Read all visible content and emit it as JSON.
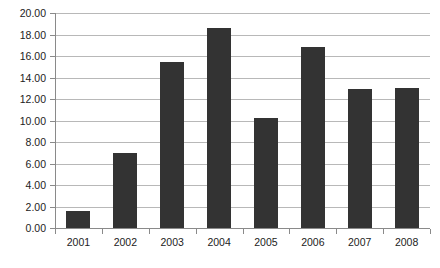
{
  "chart_data": {
    "type": "bar",
    "title": "",
    "subtitle": "",
    "xlabel": "",
    "ylabel": "",
    "categories": [
      "2001",
      "2002",
      "2003",
      "2004",
      "2005",
      "2006",
      "2007",
      "2008"
    ],
    "values": [
      1.6,
      7.0,
      15.4,
      18.6,
      10.2,
      16.8,
      12.9,
      13.0
    ],
    "series": [
      {
        "name": "",
        "values": [
          1.6,
          7.0,
          15.4,
          18.6,
          10.2,
          16.8,
          12.9,
          13.0
        ]
      }
    ],
    "ylim": [
      0,
      20
    ],
    "ytick_step": 2,
    "ytick_labels": [
      "0.00",
      "2.00",
      "4.00",
      "6.00",
      "8.00",
      "10.00",
      "12.00",
      "14.00",
      "16.00",
      "18.00",
      "20.00"
    ],
    "ytick_values": [
      0,
      2,
      4,
      6,
      8,
      10,
      12,
      14,
      16,
      18,
      20
    ],
    "xtick_labels": [
      "2001",
      "2002",
      "2003",
      "2004",
      "2005",
      "2006",
      "2007",
      "2008"
    ],
    "grid": true,
    "grid_axis": "y",
    "legend": false,
    "legend_position": "none",
    "annotations": [],
    "colors": {
      "bar": "#333333",
      "gridline": "#b8b8b8",
      "axis": "#8a8a8a",
      "text": "#222222",
      "background": "#ffffff"
    }
  },
  "layout": {
    "plot_left": 55,
    "plot_right": 430,
    "plot_top": 13,
    "plot_bottom": 228,
    "bar_width": 24,
    "y_label_right": 46,
    "x_label_baseline": 246,
    "tick_length": 5
  }
}
